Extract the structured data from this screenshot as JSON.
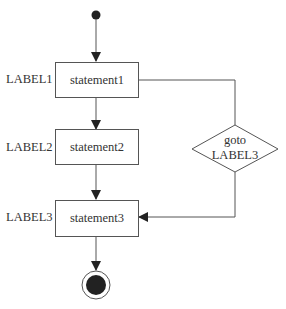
{
  "diagram": {
    "type": "activity-diagram",
    "nodes": [
      {
        "id": "start",
        "kind": "initial"
      },
      {
        "id": "s1",
        "label": "LABEL1",
        "text": "statement1"
      },
      {
        "id": "s2",
        "label": "LABEL2",
        "text": "statement2"
      },
      {
        "id": "goto",
        "kind": "decision",
        "line1": "goto",
        "line2": "LABEL3"
      },
      {
        "id": "s3",
        "label": "LABEL3",
        "text": "statement3"
      },
      {
        "id": "end",
        "kind": "final"
      }
    ],
    "edges": [
      [
        "start",
        "s1"
      ],
      [
        "s1",
        "s2"
      ],
      [
        "s2",
        "s3"
      ],
      [
        "s1",
        "goto"
      ],
      [
        "goto",
        "s3"
      ],
      [
        "s3",
        "end"
      ]
    ]
  }
}
